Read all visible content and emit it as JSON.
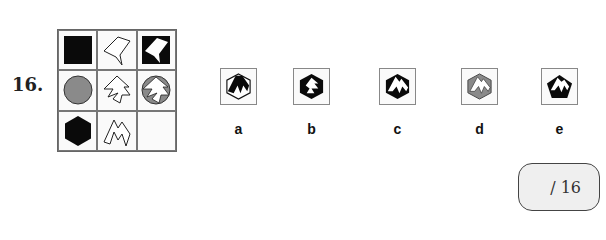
{
  "question": {
    "number": "16."
  },
  "grid": {
    "rows": 3,
    "cols": 3,
    "cells": [
      {
        "row": 1,
        "col": 1,
        "description": "black square"
      },
      {
        "row": 1,
        "col": 2,
        "description": "white irregular polygon outline"
      },
      {
        "row": 1,
        "col": 3,
        "description": "white polygon on black square"
      },
      {
        "row": 2,
        "col": 1,
        "description": "gray circle"
      },
      {
        "row": 2,
        "col": 2,
        "description": "white zigzag polygon outline"
      },
      {
        "row": 2,
        "col": 3,
        "description": "white zigzag polygon on gray circle"
      },
      {
        "row": 3,
        "col": 1,
        "description": "black hexagon"
      },
      {
        "row": 3,
        "col": 2,
        "description": "white spiky polygon outline"
      },
      {
        "row": 3,
        "col": 3,
        "description": "empty (missing)"
      }
    ]
  },
  "options": [
    {
      "label": "a",
      "description": "black spiky shape on white hexagon"
    },
    {
      "label": "b",
      "description": "white zigzag on black hexagon"
    },
    {
      "label": "c",
      "description": "white spiky shape on black hexagon"
    },
    {
      "label": "d",
      "description": "white spiky shape on gray hexagon"
    },
    {
      "label": "e",
      "description": "white spiky shape on black pentagon"
    }
  ],
  "score": {
    "text": "/ 16"
  },
  "colors": {
    "black": "#0a0a0a",
    "gray": "#8a8a8a",
    "white": "#ffffff",
    "border": "#777777"
  }
}
